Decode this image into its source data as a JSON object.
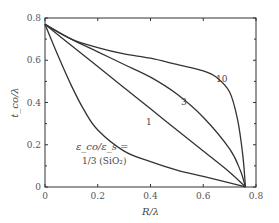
{
  "chart_data": {
    "type": "line",
    "title": "",
    "xlabel": "R/λ",
    "ylabel": "t_co/λ",
    "xlim": [
      0,
      0.8
    ],
    "ylim": [
      0,
      0.8
    ],
    "x_ticks": [
      "0",
      "0.2",
      "0.4",
      "0.6",
      "0.8"
    ],
    "y_ticks": [
      "0",
      "0.2",
      "0.4",
      "0.6",
      "0.8"
    ],
    "grid": false,
    "annotation": {
      "line1": "ε_co/ε_s =",
      "line2": "1/3 (SiO₂)"
    },
    "series": [
      {
        "name": "1/3",
        "label": "",
        "x": [
          0,
          0.05,
          0.1,
          0.15,
          0.2,
          0.3,
          0.4,
          0.5,
          0.6,
          0.7,
          0.76
        ],
        "y": [
          0.77,
          0.62,
          0.48,
          0.36,
          0.27,
          0.17,
          0.12,
          0.08,
          0.05,
          0.02,
          0
        ]
      },
      {
        "name": "1",
        "label": "1",
        "x": [
          0,
          0.1,
          0.2,
          0.3,
          0.4,
          0.5,
          0.6,
          0.7,
          0.76
        ],
        "y": [
          0.77,
          0.67,
          0.57,
          0.47,
          0.37,
          0.27,
          0.17,
          0.07,
          0
        ]
      },
      {
        "name": "3",
        "label": "3",
        "x": [
          0,
          0.1,
          0.2,
          0.3,
          0.4,
          0.5,
          0.6,
          0.7,
          0.74,
          0.76
        ],
        "y": [
          0.77,
          0.7,
          0.64,
          0.58,
          0.52,
          0.44,
          0.33,
          0.18,
          0.08,
          0
        ]
      },
      {
        "name": "10",
        "label": "10",
        "x": [
          0,
          0.1,
          0.2,
          0.3,
          0.4,
          0.5,
          0.6,
          0.65,
          0.7,
          0.73,
          0.75,
          0.76
        ],
        "y": [
          0.77,
          0.7,
          0.66,
          0.63,
          0.61,
          0.58,
          0.55,
          0.52,
          0.45,
          0.32,
          0.15,
          0
        ]
      }
    ]
  }
}
